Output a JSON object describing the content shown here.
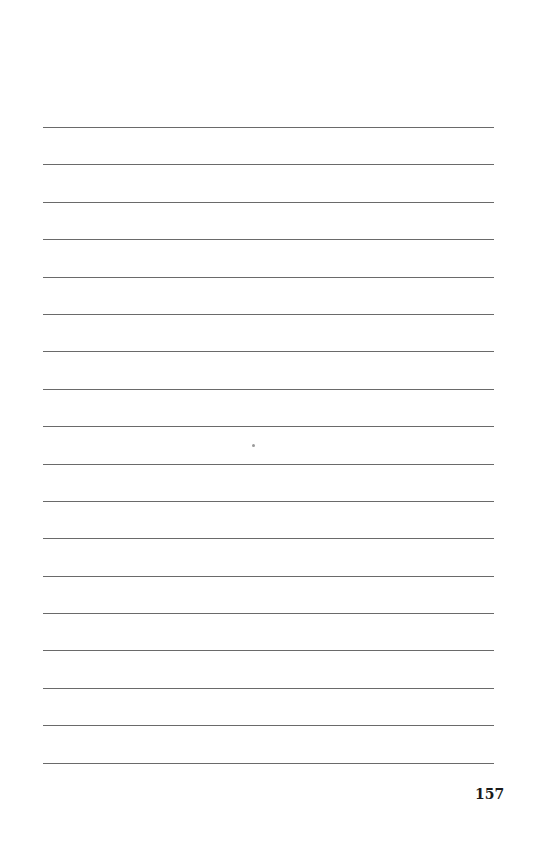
{
  "page": {
    "type": "lined notes page",
    "line_count": 18,
    "page_number": "157"
  }
}
